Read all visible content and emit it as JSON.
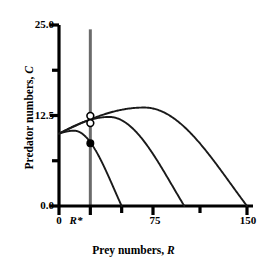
{
  "chart_data": {
    "type": "line",
    "title": "",
    "xlabel": "Prey numbers, R",
    "ylabel": "Predator numbers, C",
    "xlim": [
      0,
      160
    ],
    "ylim": [
      0,
      25
    ],
    "grid": false,
    "legend": null,
    "x_ticks": [
      {
        "value": 0,
        "label": "0"
      },
      {
        "value": 25,
        "label": "R*"
      },
      {
        "value": 50,
        "label": ""
      },
      {
        "value": 75,
        "label": "75"
      },
      {
        "value": 112.5,
        "label": ""
      },
      {
        "value": 150,
        "label": "150"
      }
    ],
    "y_ticks": [
      {
        "value": 0,
        "label": "0.0"
      },
      {
        "value": 6.25,
        "label": ""
      },
      {
        "value": 12.5,
        "label": "12.5"
      },
      {
        "value": 18.75,
        "label": ""
      },
      {
        "value": 25,
        "label": "25.0"
      }
    ],
    "series": [
      {
        "name": "prey-isocline-small",
        "kind": "hump",
        "y_intercept": 10.0,
        "x_zero": 50,
        "peak_x": 12,
        "peak_y": 10.4,
        "color": "#1a1a1a"
      },
      {
        "name": "prey-isocline-medium",
        "kind": "hump",
        "y_intercept": 10.0,
        "x_zero": 100,
        "peak_x": 40,
        "peak_y": 12.3,
        "color": "#1a1a1a"
      },
      {
        "name": "prey-isocline-large",
        "kind": "hump",
        "y_intercept": 10.0,
        "x_zero": 150,
        "peak_x": 68,
        "peak_y": 13.6,
        "color": "#1a1a1a"
      }
    ],
    "vertical_line": {
      "name": "predator-isocline",
      "x": 25,
      "y_from": 0,
      "y_to": 24.4,
      "label": "R*",
      "color": "#6b6b6b"
    },
    "markers": [
      {
        "name": "equilibrium-open-upper",
        "x": 25,
        "y": 12.45,
        "style": "open"
      },
      {
        "name": "equilibrium-open-lower",
        "x": 25,
        "y": 11.45,
        "style": "open"
      },
      {
        "name": "equilibrium-filled",
        "x": 25,
        "y": 8.65,
        "style": "filled"
      }
    ],
    "axis_color": "#000000",
    "curve_color": "#1a1a1a"
  },
  "labels": {
    "x_axis_title_main": "Prey numbers,",
    "x_axis_title_var": "R",
    "y_axis_title_main": "Predator numbers,",
    "y_axis_title_var": "C"
  }
}
